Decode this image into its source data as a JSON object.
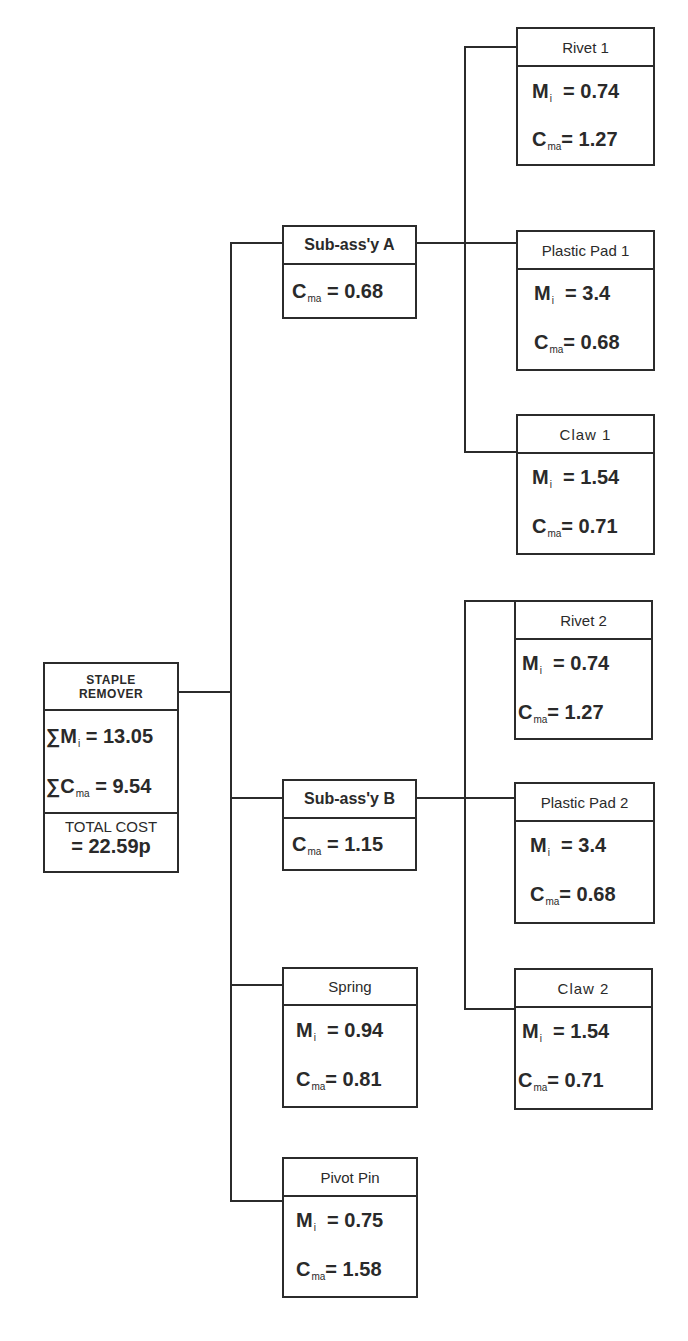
{
  "root": {
    "title_line1": "STAPLE",
    "title_line2": "REMOVER",
    "sum_mi_prefix": "∑M",
    "sum_mi_sub": "i",
    "sum_mi_value": "= 13.05",
    "sum_cma_prefix": "∑C",
    "sum_cma_sub": "ma",
    "sum_cma_value": "= 9.54",
    "total_label": "TOTAL COST",
    "total_value": "= 22.59p"
  },
  "labels": {
    "m": "M",
    "m_sub": "i",
    "c": "C",
    "c_sub": "ma"
  },
  "subassemblies": [
    {
      "name": "Sub-ass'y A",
      "cma": "= 0.68"
    },
    {
      "name": "Sub-ass'y B",
      "cma": "= 1.15"
    }
  ],
  "parts": [
    {
      "name": "Rivet 1",
      "mi": "= 0.74",
      "cma": "= 1.27"
    },
    {
      "name": "Plastic Pad 1",
      "mi": "= 3.4",
      "cma": "= 0.68"
    },
    {
      "name": "Claw 1",
      "mi": "= 1.54",
      "cma": "= 0.71"
    },
    {
      "name": "Rivet 2",
      "mi": "= 0.74",
      "cma": "= 1.27"
    },
    {
      "name": "Plastic Pad 2",
      "mi": "= 3.4",
      "cma": "= 0.68"
    },
    {
      "name": "Claw 2",
      "mi": "= 1.54",
      "cma": "= 0.71"
    },
    {
      "name": "Spring",
      "mi": "= 0.94",
      "cma": "= 0.81"
    },
    {
      "name": "Pivot Pin",
      "mi": "= 0.75",
      "cma": "= 1.58"
    }
  ]
}
